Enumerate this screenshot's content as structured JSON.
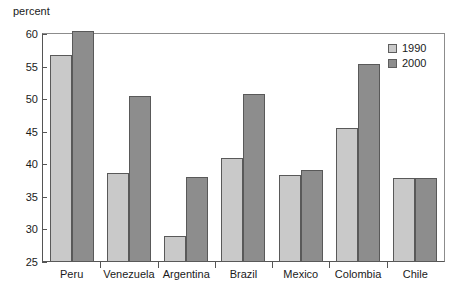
{
  "chart_data": {
    "type": "bar",
    "title": "",
    "xlabel": "",
    "ylabel": "percent",
    "ylim": [
      25,
      60
    ],
    "ytick_values": [
      25,
      30,
      35,
      40,
      45,
      50,
      55,
      60
    ],
    "ytick_labels": [
      "25",
      "30",
      "35",
      "40",
      "45",
      "50",
      "55",
      "60"
    ],
    "grid": false,
    "legend_position": "top-right",
    "categories": [
      "Peru",
      "Venezuela",
      "Argentina",
      "Brazil",
      "Mexico",
      "Colombia",
      "Chile"
    ],
    "series": [
      {
        "name": "1990",
        "color": "#c9c9c9",
        "values": [
          56.8,
          38.6,
          29.0,
          41.0,
          38.3,
          45.6,
          37.9
        ]
      },
      {
        "name": "2000",
        "color": "#8d8d8d",
        "values": [
          60.4,
          50.5,
          38.0,
          50.8,
          39.1,
          55.4,
          37.9
        ]
      }
    ]
  },
  "legend": {
    "entries": [
      {
        "label": "1990"
      },
      {
        "label": "2000"
      }
    ]
  },
  "colors": {
    "series_1990": "#c9c9c9",
    "series_2000": "#8d8d8d",
    "axis": "#555555",
    "background": "#ffffff"
  }
}
